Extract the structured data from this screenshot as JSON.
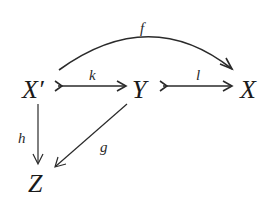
{
  "diagram": {
    "type": "commutative-diagram",
    "nodes": {
      "x_prime": "X′",
      "y": "Y",
      "x": "X",
      "z": "Z"
    },
    "edges": {
      "f": {
        "label": "f",
        "from": "X′",
        "to": "X",
        "style": "curved arrow"
      },
      "k": {
        "label": "k",
        "from": "X′",
        "to": "Y",
        "style": "monomorphism (tailed arrow)"
      },
      "l": {
        "label": "l",
        "from": "Y",
        "to": "X",
        "style": "monomorphism (tailed arrow)"
      },
      "h": {
        "label": "h",
        "from": "X′",
        "to": "Z",
        "style": "arrow"
      },
      "g": {
        "label": "g",
        "from": "Y",
        "to": "Z",
        "style": "arrow"
      }
    }
  }
}
